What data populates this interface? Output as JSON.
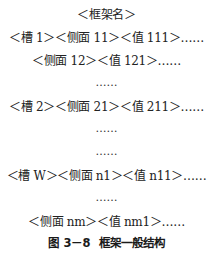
{
  "figure": {
    "lines": [
      {
        "text": "＜框架名＞"
      },
      {
        "text": "＜槽 1＞＜侧面 11＞＜值 111＞……"
      },
      {
        "text": "＜侧面 12＞＜值 121＞……"
      },
      {
        "text": "……"
      },
      {
        "text": "＜槽 2＞＜侧面 21＞＜值 211＞……"
      },
      {
        "text": "……"
      },
      {
        "text": "……"
      },
      {
        "text": "＜槽 W＞＜侧面 n1＞＜值 n11＞……"
      },
      {
        "text": "……"
      },
      {
        "text": "＜侧面 nm＞＜值 nm1＞……"
      }
    ],
    "caption": {
      "number": "图 3－8",
      "title": "框架一般结构"
    }
  }
}
